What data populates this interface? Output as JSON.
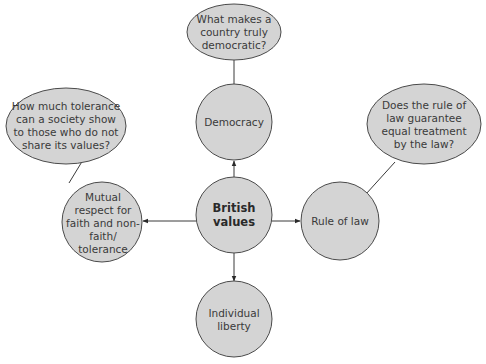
{
  "caption_fragment": "",
  "colors": {
    "node_fill": "#d4d4d4",
    "node_stroke": "#4a4a4a",
    "line": "#3a3a3a",
    "text": "#3a3a3a"
  },
  "central": {
    "label": "British values"
  },
  "values": [
    {
      "id": "democracy",
      "label": "Democracy",
      "question": "What makes a country truly democratic?"
    },
    {
      "id": "rule-of-law",
      "label": "Rule of law",
      "question": "Does the rule of law guarantee equal treatment by the law?"
    },
    {
      "id": "mutual-respect",
      "label": "Mutual respect for faith and non-faith/ tolerance",
      "question": "How much tolerance can a society show to those who do not share its values?"
    },
    {
      "id": "individual-liberty",
      "label": "Individual liberty"
    }
  ]
}
